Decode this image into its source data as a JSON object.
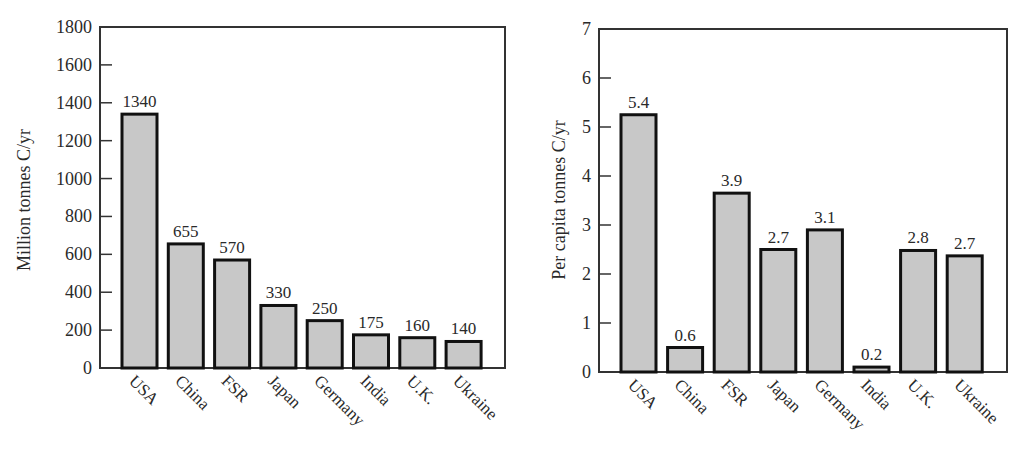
{
  "chart_data": [
    {
      "type": "bar",
      "title": "",
      "xlabel": "",
      "ylabel": "Million tonnes C/yr",
      "ylim": [
        0,
        1800
      ],
      "yticks": [
        0,
        200,
        400,
        600,
        800,
        1000,
        1200,
        1400,
        1600,
        1800
      ],
      "grid": false,
      "categories": [
        "USA",
        "China",
        "FSR",
        "Japan",
        "Germany",
        "India",
        "U.K.",
        "Ukraine"
      ],
      "values": [
        1340,
        655,
        570,
        330,
        250,
        175,
        160,
        140
      ],
      "value_labels": [
        "1340",
        "655",
        "570",
        "330",
        "250",
        "175",
        "160",
        "140"
      ]
    },
    {
      "type": "bar",
      "title": "",
      "xlabel": "",
      "ylabel": "Per capita tonnes C/yr",
      "ylim": [
        0,
        7
      ],
      "yticks": [
        0,
        1,
        2,
        3,
        4,
        5,
        6,
        7
      ],
      "grid": false,
      "categories": [
        "USA",
        "China",
        "FSR",
        "Japan",
        "Germany",
        "India",
        "U.K.",
        "Ukraine"
      ],
      "values": [
        5.25,
        0.5,
        3.65,
        2.5,
        2.9,
        0.1,
        2.48,
        2.37
      ],
      "value_labels": [
        "5.4",
        "0.6",
        "3.9",
        "2.7",
        "3.1",
        "0.2",
        "2.8",
        "2.7"
      ]
    }
  ]
}
